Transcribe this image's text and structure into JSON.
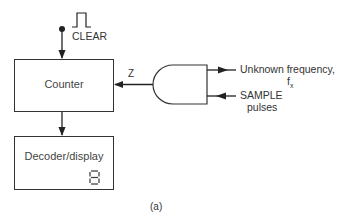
{
  "diagram": {
    "type": "block-diagram",
    "caption": "(a)",
    "blocks": [
      {
        "id": "counter",
        "label": "Counter"
      },
      {
        "id": "decoder",
        "label": "Decoder/display",
        "display_digit": "8"
      }
    ],
    "gate": {
      "type": "AND",
      "output_label": "Z"
    },
    "signals": {
      "clear": "CLEAR",
      "unknown_frequency_line1": "Unknown frequency,",
      "unknown_frequency_line2": "f",
      "unknown_frequency_subscript": "x",
      "sample_line1": "SAMPLE",
      "sample_line2": "pulses"
    },
    "connections": [
      {
        "from": "CLEAR",
        "to": "counter"
      },
      {
        "from": "AND gate",
        "to": "counter",
        "label": "Z"
      },
      {
        "from": "counter",
        "to": "decoder"
      },
      {
        "from": "Unknown frequency, fx",
        "to": "AND gate"
      },
      {
        "from": "SAMPLE pulses",
        "to": "AND gate"
      }
    ],
    "colors": {
      "line": "#222222",
      "text": "#333333",
      "background": "#ffffff"
    }
  }
}
